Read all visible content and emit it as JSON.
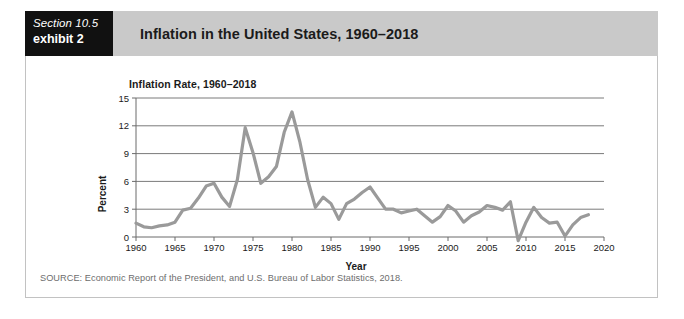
{
  "exhibit": {
    "section_label": "Section 10.5",
    "exhibit_label": "exhibit 2",
    "title": "Inflation in the United States, 1960–2018",
    "source_note": "SOURCE: Economic Report of the President, and U.S. Bureau of Labor Statistics, 2018.",
    "header_bg": "#c9c9c9",
    "tag_bg": "#111111",
    "panel_bg": "#ffffff",
    "panel_border": "#c2c2c2"
  },
  "chart_data": {
    "type": "line",
    "title": "Inflation Rate, 1960–2018",
    "xlabel": "Year",
    "ylabel": "Percent",
    "xlim": [
      1960,
      2020
    ],
    "ylim": [
      0,
      15
    ],
    "yticks": [
      0,
      3,
      6,
      9,
      12,
      15
    ],
    "xticks": [
      1960,
      1965,
      1970,
      1975,
      1980,
      1985,
      1990,
      1995,
      2000,
      2005,
      2010,
      2015,
      2020
    ],
    "grid": "horizontal",
    "legend": "none",
    "line_color": "#9a9a9a",
    "axis_color": "#6b6b6b",
    "grid_color": "#7a7a7a",
    "series": [
      {
        "name": "Inflation Rate",
        "x": [
          1960,
          1961,
          1962,
          1963,
          1964,
          1965,
          1966,
          1967,
          1968,
          1969,
          1970,
          1971,
          1972,
          1973,
          1974,
          1975,
          1976,
          1977,
          1978,
          1979,
          1980,
          1981,
          1982,
          1983,
          1984,
          1985,
          1986,
          1987,
          1988,
          1989,
          1990,
          1991,
          1992,
          1993,
          1994,
          1995,
          1996,
          1997,
          1998,
          1999,
          2000,
          2001,
          2002,
          2003,
          2004,
          2005,
          2006,
          2007,
          2008,
          2009,
          2010,
          2011,
          2012,
          2013,
          2014,
          2015,
          2016,
          2017,
          2018
        ],
        "values": [
          1.5,
          1.1,
          1.0,
          1.2,
          1.3,
          1.6,
          2.9,
          3.1,
          4.2,
          5.5,
          5.8,
          4.3,
          3.3,
          6.2,
          11.8,
          9.1,
          5.8,
          6.5,
          7.6,
          11.3,
          13.5,
          10.3,
          6.2,
          3.2,
          4.3,
          3.6,
          1.9,
          3.6,
          4.1,
          4.8,
          5.4,
          4.2,
          3.0,
          3.0,
          2.6,
          2.8,
          3.0,
          2.3,
          1.6,
          2.2,
          3.4,
          2.8,
          1.6,
          2.3,
          2.7,
          3.4,
          3.2,
          2.9,
          3.8,
          -0.4,
          1.6,
          3.2,
          2.1,
          1.5,
          1.6,
          0.1,
          1.3,
          2.1,
          2.4
        ]
      }
    ]
  }
}
